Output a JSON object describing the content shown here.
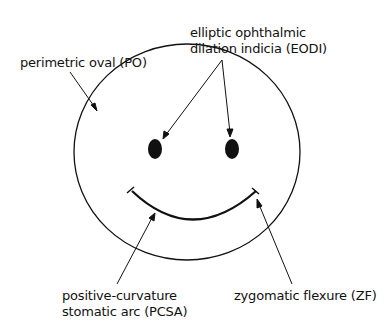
{
  "labels": {
    "eodi_line1": "elliptic ophthalmic",
    "eodi_line2": "dilation indicia (EODI)",
    "po": "perimetric oval (PO)",
    "pcsa_line1": "positive-curvature",
    "pcsa_line2": "stomatic arc (PCSA)",
    "zf": "zygomatic flexure (ZF)"
  },
  "colors": {
    "ink": "#111111",
    "background": "#ffffff"
  }
}
